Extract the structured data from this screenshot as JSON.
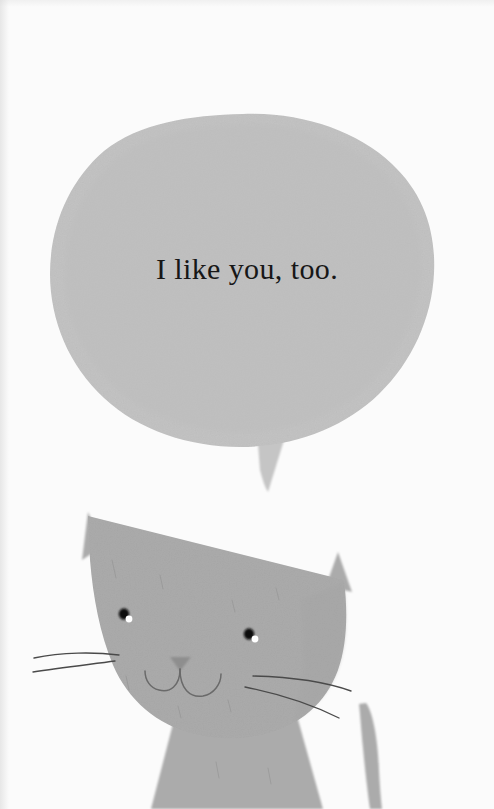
{
  "illustration": {
    "title": "Cat with speech bubble",
    "background_color": "#fbfbfb"
  },
  "speech_bubble": {
    "text": "I like you, too.",
    "fill_color": "#c3c3c3",
    "shape": "organic-oval",
    "tail": "downward-pointed"
  },
  "cat": {
    "fill_color": "#ababab",
    "line_color": "#5d5d5d",
    "eye_color": "#111111",
    "eye_highlight_color": "#ffffff",
    "nose_color": "#8e8e8e",
    "parts": {
      "head": "head",
      "left_ear": "left-ear",
      "right_ear": "right-ear",
      "body": "body",
      "tail": "tail",
      "left_eye": "left-eye",
      "right_eye": "right-eye",
      "nose": "nose",
      "mouth": "mouth",
      "whiskers": "whiskers"
    }
  }
}
